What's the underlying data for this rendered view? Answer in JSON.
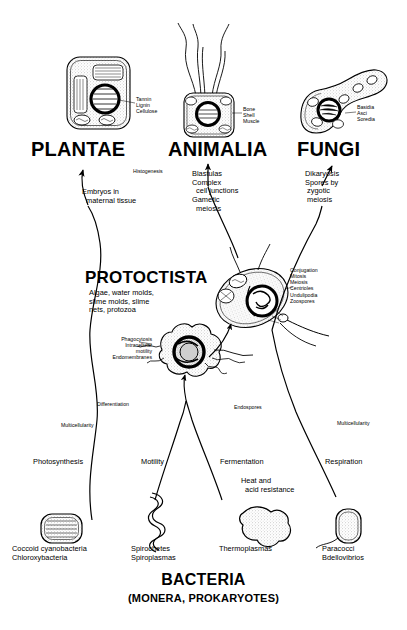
{
  "diagram": {
    "base_title": "BACTERIA",
    "base_subtitle": "(MONERA, PROKARYOTES)"
  },
  "kingdoms": [
    {
      "id": "plantae",
      "name": "PLANTAE",
      "cell_labels": "Tannin\nLignin\nCellulose",
      "transition": "Embryos in\n  maternal tissue",
      "secondary": "Histogenesis"
    },
    {
      "id": "animalia",
      "name": "ANIMALIA",
      "cell_labels": "Bone\nShell\nMuscle",
      "transition": "Blastulas\nComplex\n  cell junctions\nGametic\n  meiosis",
      "secondary": ""
    },
    {
      "id": "fungi",
      "name": "FUNGI",
      "cell_labels": "Basidia\nAsci\nSoredia",
      "transition": "Dikaryosis\nSpores by\n zygotic\n meiosis",
      "secondary": ""
    }
  ],
  "protoctista": {
    "name": "PROTOCTISTA",
    "description": "Algae, water molds,\nslime molds, slime\nnets, protozoa",
    "features_right": "Conjugation\nMitosis\nMeiosis\nCentrioles\nUndulipodia\nZoospores",
    "features_left": "Phagocytosis\nIntracellular\nmotility\nEndomembranes"
  },
  "transitions": {
    "differentiation": "Differentiation",
    "multicellularity_left": "Multicellularity",
    "multicellularity_right": "Multicellularity",
    "endospores": "Endospores",
    "photosynthesis": "Photosynthesis",
    "motility": "Motility",
    "fermentation": "Fermentation",
    "heat_acid": "Heat and\n  acid resistance",
    "respiration": "Respiration"
  },
  "bacteria": [
    {
      "id": "cyanobacteria",
      "label": "Coccoid cyanobacteria\nChloroxybacteria"
    },
    {
      "id": "spirochetes",
      "label": "Spirochetes\nSpiroplasmas"
    },
    {
      "id": "thermoplasmas",
      "label": "Thermoplasmas"
    },
    {
      "id": "paracocci",
      "label": "Paracocci\nBdellovibrios"
    }
  ],
  "colors": {
    "ink": "#000000",
    "paper": "#ffffff",
    "stipple": "#b8b8b8"
  }
}
